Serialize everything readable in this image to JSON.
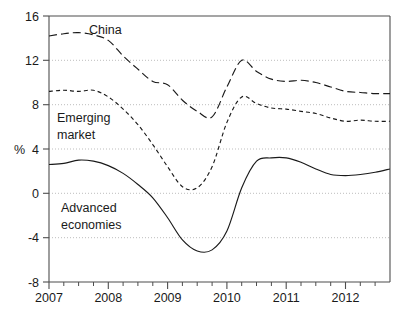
{
  "chart_data": {
    "type": "line",
    "title": "",
    "subtitle": "",
    "xlabel": "",
    "ylabel": "%",
    "ylim": [
      -8,
      16
    ],
    "xlim": [
      2007.0,
      2012.75
    ],
    "yticks": [
      16,
      12,
      8,
      4,
      0,
      -4,
      -8
    ],
    "ytick_labels": [
      "16",
      "12",
      "8",
      "4",
      "0",
      "-4",
      "-8"
    ],
    "xticks": [
      2007,
      2008,
      2009,
      2010,
      2011,
      2012
    ],
    "xtick_labels": [
      "2007",
      "2008",
      "2009",
      "2010",
      "2011",
      "2012"
    ],
    "minor_xticks_per_year": 4,
    "grid": "horizontal-dotted",
    "legend": "inline-annotations",
    "x": [
      2007.0,
      2007.25,
      2007.5,
      2007.75,
      2008.0,
      2008.25,
      2008.5,
      2008.75,
      2009.0,
      2009.25,
      2009.5,
      2009.75,
      2010.0,
      2010.25,
      2010.5,
      2010.75,
      2011.0,
      2011.25,
      2011.5,
      2011.75,
      2012.0,
      2012.25,
      2012.5,
      2012.75
    ],
    "series": [
      {
        "name": "China",
        "dash": "long",
        "color": "#1a1a1a",
        "label_x": 2008.05,
        "label_y": 14.6,
        "values": [
          14.2,
          14.4,
          14.5,
          14.3,
          13.8,
          12.4,
          11.2,
          10.1,
          9.8,
          8.4,
          7.4,
          6.9,
          9.6,
          12.0,
          11.0,
          10.3,
          10.1,
          10.2,
          10.0,
          9.6,
          9.2,
          9.1,
          9.0,
          9.0
        ]
      },
      {
        "name": "Emerging market",
        "dash": "short",
        "color": "#1a1a1a",
        "label_x": 2007.15,
        "label_y": 6.6,
        "values": [
          9.2,
          9.3,
          9.2,
          9.3,
          8.7,
          7.6,
          6.2,
          4.4,
          2.4,
          0.6,
          0.5,
          2.4,
          6.4,
          8.7,
          8.1,
          7.7,
          7.6,
          7.4,
          7.2,
          6.8,
          6.5,
          6.6,
          6.5,
          6.5
        ]
      },
      {
        "name": "Advanced economies",
        "dash": "solid",
        "color": "#1a1a1a",
        "label_x": 2007.2,
        "label_y": -1.0,
        "values": [
          2.6,
          2.7,
          3.0,
          2.9,
          2.5,
          1.8,
          0.8,
          -0.4,
          -2.2,
          -4.2,
          -5.2,
          -5.1,
          -3.4,
          0.5,
          2.9,
          3.2,
          3.2,
          2.8,
          2.2,
          1.7,
          1.6,
          1.7,
          1.9,
          2.2
        ]
      }
    ]
  },
  "labels": {
    "china": "China",
    "emerging_line1": "Emerging",
    "emerging_line2": "market",
    "advanced_line1": "Advanced",
    "advanced_line2": "economies",
    "percent": "%",
    "y16": "16",
    "y12": "12",
    "y8": "8",
    "y4": "4",
    "y0": "0",
    "ym4": "-4",
    "ym8": "-8",
    "x2007": "2007",
    "x2008": "2008",
    "x2009": "2009",
    "x2010": "2010",
    "x2011": "2011",
    "x2012": "2012"
  }
}
